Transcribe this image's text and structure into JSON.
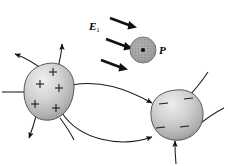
{
  "figure": {
    "background_color": "#ffffff",
    "width": 228,
    "height": 166
  },
  "labels": {
    "field_symbol": "E",
    "field_subscript": "1",
    "point_label": "P"
  },
  "colors": {
    "stroke": "#000000",
    "blob_fill_light": "#e6e6e6",
    "blob_fill_mid": "#b8b8b8",
    "blob_fill_dark": "#8f8f8f",
    "blob_outline": "#3a3a3a",
    "circle_fill": "#9a9a9a",
    "circle_dot": "#111111",
    "arrow_fill": "#111111"
  },
  "charges": {
    "positive": {
      "symbol": "+",
      "count": 5,
      "positions": [
        {
          "x": 52,
          "y": 72
        },
        {
          "x": 66,
          "y": 77
        },
        {
          "x": 40,
          "y": 84
        },
        {
          "x": 58,
          "y": 90
        },
        {
          "x": 35,
          "y": 105
        },
        {
          "x": 56,
          "y": 108
        }
      ]
    },
    "negative": {
      "symbol": "−",
      "count": 4,
      "positions": [
        {
          "x": 163,
          "y": 104
        },
        {
          "x": 188,
          "y": 99
        },
        {
          "x": 160,
          "y": 128
        },
        {
          "x": 184,
          "y": 127
        }
      ]
    }
  },
  "external_field": {
    "name": "E1-uniform-field",
    "arrow_count": 3,
    "direction": "down-right",
    "arrows": [
      {
        "x1": 110,
        "y1": 19,
        "x2": 133,
        "y2": 27
      },
      {
        "x1": 106,
        "y1": 40,
        "x2": 129,
        "y2": 48
      },
      {
        "x1": 101,
        "y1": 60,
        "x2": 124,
        "y2": 68
      }
    ]
  },
  "test_point": {
    "name": "point-P",
    "cx": 143,
    "cy": 50,
    "r": 13,
    "has_center_dot": true
  },
  "field_lines": {
    "count": 7,
    "description": "curved field lines from positive body to negative body and outward"
  }
}
